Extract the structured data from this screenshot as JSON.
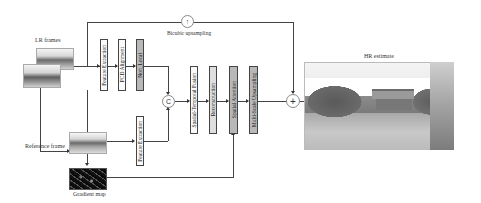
{
  "diagram": {
    "inputs": {
      "lr_frames_label": "LR frames",
      "reference_frame_label": "Reference frame",
      "gradient_map_label": "Gradient map"
    },
    "upsampling": {
      "label": "Bicubic upsampling",
      "symbol": "↑"
    },
    "top_branch": [
      {
        "label": "Feature Extraction",
        "style": "white"
      },
      {
        "label": "PCD Alignment",
        "style": "white"
      },
      {
        "label": "Non_Local",
        "style": "gray"
      }
    ],
    "bottom_branch": [
      {
        "label": "Feature Extraction",
        "style": "white"
      }
    ],
    "concat": {
      "symbol": "C"
    },
    "main_chain": [
      {
        "label": "Spatial-Temporal Fusion",
        "style": "white"
      },
      {
        "label": "Reconstruction",
        "style": "lgray"
      },
      {
        "label": "Spatial Attention",
        "style": "gray"
      },
      {
        "label": "Multi-Scale Upsampling",
        "style": "gray"
      }
    ],
    "sum": {
      "symbol": "+"
    },
    "output": {
      "label": "HR estimate"
    }
  }
}
